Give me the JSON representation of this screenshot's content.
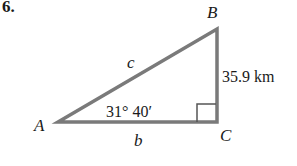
{
  "problem_number": "6.",
  "triangle": {
    "vertices": {
      "A": "A",
      "B": "B",
      "C": "C"
    },
    "sides": {
      "hypotenuse": "c",
      "base": "b",
      "vertical": "35.9 km"
    },
    "angle_A": "31° 40′",
    "right_angle_at": "C"
  },
  "colors": {
    "stroke": "#7a7a7a",
    "text": "#1a1a1a"
  }
}
